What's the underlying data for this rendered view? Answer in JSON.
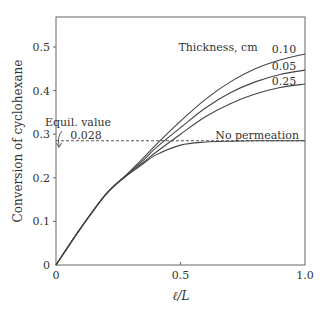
{
  "chart_data": {
    "type": "line",
    "title": "",
    "xlabel": "ℓ/L",
    "ylabel": "Conversion of cyclohexane",
    "xlim": [
      0,
      1.0
    ],
    "ylim": [
      0,
      0.57
    ],
    "x_ticks": [
      "0",
      "0.5",
      "1.0"
    ],
    "y_ticks": [
      "0",
      "0.1",
      "0.2",
      "0.3",
      "0.4",
      "0.5"
    ],
    "grid": false,
    "legend_title": "Thickness, cm",
    "annotation": {
      "label_line1": "Equil. value",
      "label_line2": "0.028",
      "equilibrium_y": 0.285
    },
    "series": [
      {
        "name": "0.10",
        "x": [
          0,
          0.1,
          0.2,
          0.28,
          0.35,
          0.4,
          0.5,
          0.6,
          0.7,
          0.8,
          0.9,
          1.0
        ],
        "values": [
          0,
          0.085,
          0.162,
          0.205,
          0.245,
          0.275,
          0.33,
          0.38,
          0.42,
          0.45,
          0.47,
          0.484
        ]
      },
      {
        "name": "0.05",
        "x": [
          0,
          0.1,
          0.2,
          0.28,
          0.35,
          0.4,
          0.5,
          0.6,
          0.7,
          0.8,
          0.9,
          1.0
        ],
        "values": [
          0,
          0.085,
          0.162,
          0.205,
          0.24,
          0.268,
          0.315,
          0.36,
          0.395,
          0.42,
          0.437,
          0.447
        ]
      },
      {
        "name": "0.25",
        "x": [
          0,
          0.1,
          0.2,
          0.28,
          0.35,
          0.4,
          0.5,
          0.6,
          0.7,
          0.8,
          0.9,
          1.0
        ],
        "values": [
          0,
          0.085,
          0.162,
          0.205,
          0.235,
          0.258,
          0.3,
          0.34,
          0.37,
          0.392,
          0.407,
          0.415
        ]
      },
      {
        "name": "No permeation",
        "x": [
          0,
          0.1,
          0.2,
          0.28,
          0.35,
          0.4,
          0.5,
          0.6,
          0.7,
          0.8,
          0.9,
          1.0
        ],
        "values": [
          0,
          0.085,
          0.162,
          0.203,
          0.232,
          0.252,
          0.275,
          0.282,
          0.284,
          0.285,
          0.285,
          0.285
        ]
      }
    ]
  }
}
